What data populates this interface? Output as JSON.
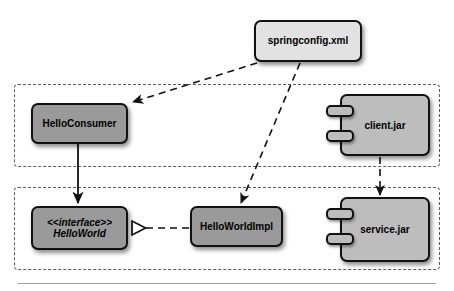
{
  "diagram": {
    "type": "uml-component-diagram",
    "colors": {
      "class_fill": "#9a9a9a",
      "artifact_fill": "#e2e2e2",
      "component_fill": "#bdbdbd",
      "stroke": "#111111",
      "package_stroke": "#5a5a5a",
      "rule": "#9d9d9d",
      "background": "#ffffff"
    },
    "packages": [
      {
        "id": "client-package",
        "name": "client-tier-package",
        "label": "",
        "x": 14,
        "y": 84,
        "w": 426,
        "h": 83
      },
      {
        "id": "service-package",
        "name": "service-tier-package",
        "label": "",
        "x": 14,
        "y": 187,
        "w": 426,
        "h": 83
      }
    ],
    "nodes": [
      {
        "id": "springconfig",
        "name": "springconfig-xml-artifact",
        "label": "springconfig.xml",
        "shape": "artifact",
        "x": 254,
        "y": 20,
        "w": 108,
        "h": 42
      },
      {
        "id": "helloconsumer",
        "name": "helloconsumer-class",
        "label": "HelloConsumer",
        "shape": "class",
        "x": 31,
        "y": 103,
        "w": 97,
        "h": 41
      },
      {
        "id": "helloworld",
        "name": "helloworld-interface",
        "label": "HelloWorld",
        "stereotype": "<<interface>>",
        "shape": "interface",
        "x": 31,
        "y": 206,
        "w": 97,
        "h": 44
      },
      {
        "id": "helloworldimpl",
        "name": "helloworldimpl-class",
        "label": "HelloWorldImpl",
        "shape": "class",
        "x": 190,
        "y": 206,
        "w": 93,
        "h": 41
      },
      {
        "id": "clientjar",
        "name": "client-jar-component",
        "label": "client.jar",
        "shape": "component",
        "x": 326,
        "y": 94,
        "w": 104,
        "h": 62
      },
      {
        "id": "servicejar",
        "name": "service-jar-component",
        "label": "service.jar",
        "shape": "component",
        "x": 326,
        "y": 197,
        "w": 104,
        "h": 65
      }
    ],
    "edges": [
      {
        "id": "edge-config-consumer",
        "name": "dependency-springconfig-to-helloconsumer",
        "from": "springconfig",
        "to": "helloconsumer",
        "style": "dashed",
        "arrow": "open-filled"
      },
      {
        "id": "edge-config-impl",
        "name": "dependency-springconfig-to-helloworldimpl",
        "from": "springconfig",
        "to": "helloworldimpl",
        "style": "dashed",
        "arrow": "open-filled"
      },
      {
        "id": "edge-consumer-interface",
        "name": "association-helloconsumer-to-helloworld",
        "from": "helloconsumer",
        "to": "helloworld",
        "style": "solid",
        "arrow": "open-filled"
      },
      {
        "id": "edge-impl-interface",
        "name": "realization-helloworldimpl-to-helloworld",
        "from": "helloworldimpl",
        "to": "helloworld",
        "style": "dashed",
        "arrow": "hollow-triangle"
      },
      {
        "id": "edge-clientjar-servicejar",
        "name": "dependency-clientjar-to-servicejar",
        "from": "clientjar",
        "to": "servicejar",
        "style": "dashed",
        "arrow": "open-filled"
      }
    ]
  }
}
